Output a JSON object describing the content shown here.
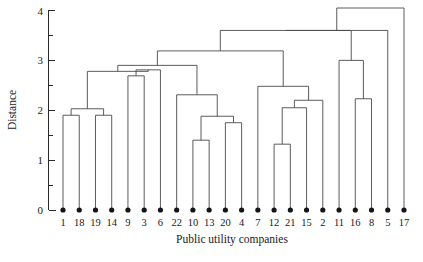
{
  "chart_data": {
    "type": "dendrogram",
    "title": "",
    "xlabel": "Public utility companies",
    "ylabel": "Distance",
    "ylim": [
      0,
      4
    ],
    "yticks": [
      0,
      1,
      2,
      3,
      4
    ],
    "ytick_labels": [
      "0",
      "1",
      "2",
      "3",
      "4"
    ],
    "yminor_ticks": [
      0.5,
      1.5,
      2.5,
      3.5
    ],
    "grid": false,
    "legend": "none",
    "leaf_order": [
      "1",
      "18",
      "19",
      "14",
      "9",
      "3",
      "6",
      "22",
      "10",
      "13",
      "20",
      "4",
      "7",
      "12",
      "21",
      "15",
      "2",
      "11",
      "16",
      "8",
      "5",
      "17"
    ],
    "leaf_count": 22,
    "merges": [
      {
        "id": "m1",
        "left": "1",
        "right": "18",
        "height": 1.9
      },
      {
        "id": "m2",
        "left": "19",
        "right": "14",
        "height": 1.9
      },
      {
        "id": "m3",
        "left": "m1",
        "right": "m2",
        "height": 2.03
      },
      {
        "id": "m4",
        "left": "9",
        "right": "3",
        "height": 2.69
      },
      {
        "id": "m5",
        "left": "m4",
        "right": "6",
        "height": 2.81
      },
      {
        "id": "m6",
        "left": "10",
        "right": "13",
        "height": 1.4
      },
      {
        "id": "m7",
        "left": "20",
        "right": "4",
        "height": 1.75
      },
      {
        "id": "m8",
        "left": "m6",
        "right": "m7",
        "height": 1.88
      },
      {
        "id": "m9",
        "left": "22",
        "right": "m8",
        "height": 2.31
      },
      {
        "id": "m10",
        "left": "12",
        "right": "21",
        "height": 1.32
      },
      {
        "id": "m11",
        "left": "m10",
        "right": "15",
        "height": 2.05
      },
      {
        "id": "m12",
        "left": "m11",
        "right": "2",
        "height": 2.2
      },
      {
        "id": "m13",
        "left": "7",
        "right": "m12",
        "height": 2.48
      },
      {
        "id": "m14",
        "left": "16",
        "right": "8",
        "height": 2.23
      },
      {
        "id": "m15",
        "left": "11",
        "right": "m14",
        "height": 3.0
      },
      {
        "id": "m16",
        "left": "m3",
        "right": "m5",
        "height": 2.78
      },
      {
        "id": "m17",
        "left": "m16",
        "right": "m9",
        "height": 2.9
      },
      {
        "id": "m18",
        "left": "m17",
        "right": "m13",
        "height": 3.19
      },
      {
        "id": "m19",
        "left": "m18",
        "right": "m15",
        "height": 3.6
      },
      {
        "id": "m20",
        "left": "m19",
        "right": "5",
        "height": 3.6
      },
      {
        "id": "m21",
        "left": "m20",
        "right": "17",
        "height": 4.05
      }
    ]
  },
  "axes": {
    "y_title": "Distance",
    "x_title": "Public utility companies"
  }
}
